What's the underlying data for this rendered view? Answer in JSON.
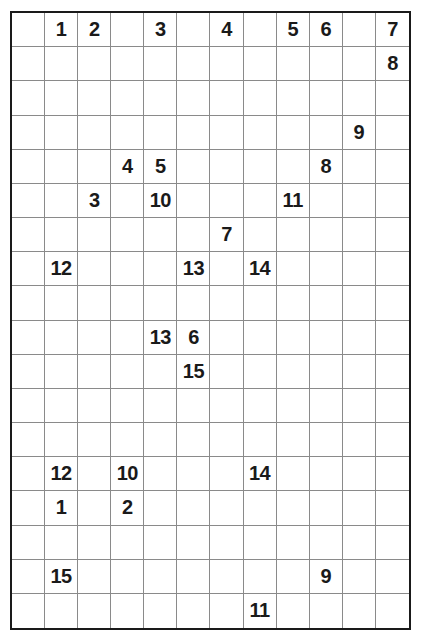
{
  "puzzle": {
    "columns": 12,
    "rows": 18,
    "clues": [
      {
        "row": 0,
        "col": 1,
        "value": "1"
      },
      {
        "row": 0,
        "col": 2,
        "value": "2"
      },
      {
        "row": 0,
        "col": 4,
        "value": "3"
      },
      {
        "row": 0,
        "col": 6,
        "value": "4"
      },
      {
        "row": 0,
        "col": 8,
        "value": "5"
      },
      {
        "row": 0,
        "col": 9,
        "value": "6"
      },
      {
        "row": 0,
        "col": 11,
        "value": "7"
      },
      {
        "row": 1,
        "col": 11,
        "value": "8"
      },
      {
        "row": 3,
        "col": 10,
        "value": "9"
      },
      {
        "row": 4,
        "col": 3,
        "value": "4"
      },
      {
        "row": 4,
        "col": 4,
        "value": "5"
      },
      {
        "row": 4,
        "col": 9,
        "value": "8"
      },
      {
        "row": 5,
        "col": 2,
        "value": "3"
      },
      {
        "row": 5,
        "col": 4,
        "value": "10"
      },
      {
        "row": 5,
        "col": 8,
        "value": "11"
      },
      {
        "row": 6,
        "col": 6,
        "value": "7"
      },
      {
        "row": 7,
        "col": 1,
        "value": "12"
      },
      {
        "row": 7,
        "col": 5,
        "value": "13"
      },
      {
        "row": 7,
        "col": 7,
        "value": "14"
      },
      {
        "row": 9,
        "col": 4,
        "value": "13"
      },
      {
        "row": 9,
        "col": 5,
        "value": "6"
      },
      {
        "row": 10,
        "col": 5,
        "value": "15"
      },
      {
        "row": 13,
        "col": 1,
        "value": "12"
      },
      {
        "row": 13,
        "col": 3,
        "value": "10"
      },
      {
        "row": 13,
        "col": 7,
        "value": "14"
      },
      {
        "row": 14,
        "col": 1,
        "value": "1"
      },
      {
        "row": 14,
        "col": 3,
        "value": "2"
      },
      {
        "row": 16,
        "col": 1,
        "value": "15"
      },
      {
        "row": 16,
        "col": 9,
        "value": "9"
      },
      {
        "row": 17,
        "col": 7,
        "value": "11"
      }
    ]
  }
}
